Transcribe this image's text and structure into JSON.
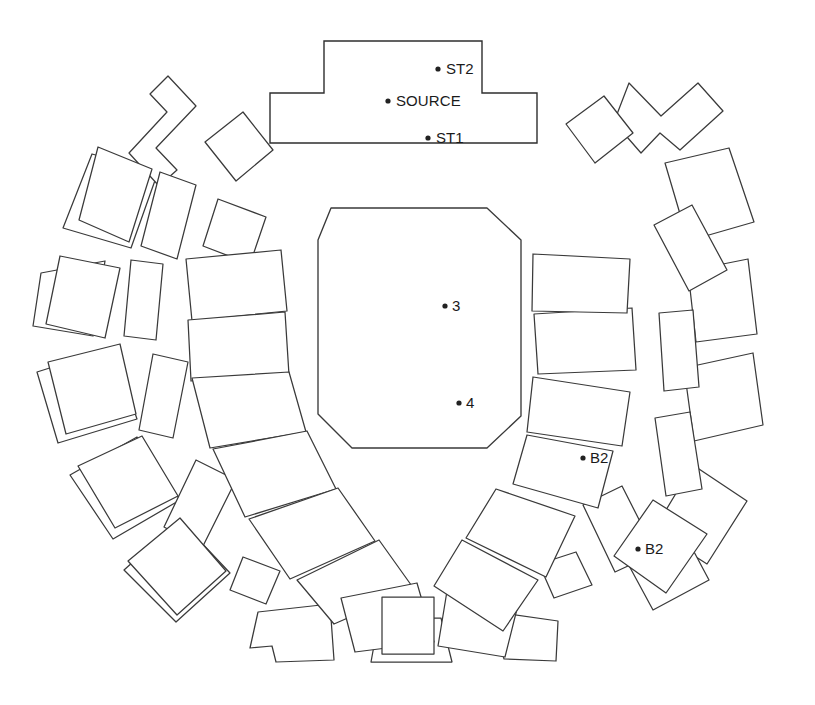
{
  "diagram": {
    "canvas": {
      "width": 815,
      "height": 705
    },
    "colors": {
      "background": "#ffffff",
      "stroke": "#3a3a3a",
      "source_stroke": "#2e2e2e",
      "marker": "#222222",
      "label_text": "#1a1a1a"
    },
    "markers": [
      {
        "id": "st2",
        "label": "ST2",
        "dot_x": 438,
        "dot_y": 69,
        "text_x": 446,
        "text_y": 70
      },
      {
        "id": "source",
        "label": "SOURCE",
        "dot_x": 388,
        "dot_y": 101,
        "text_x": 396,
        "text_y": 102
      },
      {
        "id": "st1",
        "label": "ST1",
        "dot_x": 428,
        "dot_y": 138,
        "text_x": 436,
        "text_y": 139
      },
      {
        "id": "p3",
        "label": "3",
        "dot_x": 445,
        "dot_y": 306,
        "text_x": 452,
        "text_y": 307
      },
      {
        "id": "p4",
        "label": "4",
        "dot_x": 459,
        "dot_y": 403,
        "text_x": 466,
        "text_y": 404
      },
      {
        "id": "b2-upper",
        "label": "B2",
        "dot_x": 583,
        "dot_y": 458,
        "text_x": 590,
        "text_y": 459
      },
      {
        "id": "b2-lower",
        "label": "B2",
        "dot_x": 638,
        "dot_y": 549,
        "text_x": 645,
        "text_y": 550
      }
    ],
    "source_structure": {
      "name": "source-structure",
      "points": "324,41 482,41 482,93 537,93 537,143 270,143 270,93 324,93"
    },
    "inner_chamber": {
      "name": "inner-chamber",
      "points": "331,208 487,208 521,240 521,416 487,448 352,448 318,414 318,240"
    },
    "inner_ring_blocks": [
      {
        "name": "inner-block-w-upper",
        "points": "186,259 281,250 287,311 192,321"
      },
      {
        "name": "inner-block-w-lower",
        "points": "188,320 285,312 289,375 191,381"
      },
      {
        "name": "inner-block-wsw",
        "points": "192,378 289,372 306,432 210,448"
      },
      {
        "name": "inner-block-sw-1",
        "points": "213,449 307,431 336,489 245,517"
      },
      {
        "name": "inner-block-sw-2",
        "points": "249,519 338,488 375,541 290,579"
      },
      {
        "name": "inner-block-s-1",
        "points": "297,580 379,540 414,589 334,624"
      },
      {
        "name": "inner-block-s-2",
        "points": "341,598 417,583 434,642 355,652"
      },
      {
        "name": "inner-block-s-center",
        "points": "382,597 434,597 434,654 382,654"
      },
      {
        "name": "inner-block-s-3",
        "points": "447,591 519,601 505,657 438,646"
      },
      {
        "name": "inner-block-se-1",
        "points": "462,540 538,580 503,631 434,586"
      },
      {
        "name": "inner-block-se-2",
        "points": "496,489 575,516 546,577 466,538"
      },
      {
        "name": "inner-block-e-lower",
        "points": "527,435 613,451 598,508 513,484"
      },
      {
        "name": "inner-block-e-mid",
        "points": "533,377 630,392 622,446 527,432"
      },
      {
        "name": "inner-block-e-upper",
        "points": "534,314 632,308 636,370 538,374"
      },
      {
        "name": "inner-block-ene",
        "points": "533,254 630,259 627,313 532,311"
      }
    ],
    "mid_ring_blocks": [
      {
        "name": "mid-block-nw-notched",
        "points": "168,76 196,106 156,148 177,170 159,186 129,153 167,112 150,94"
      },
      {
        "name": "mid-block-nnw",
        "points": "205,142 243,112 273,150 236,181"
      },
      {
        "name": "mid-block-nw-sq",
        "points": "98,147 152,169 129,242 79,220"
      },
      {
        "name": "mid-block-wnw-tall",
        "points": "160,172 196,185 177,259 141,246"
      },
      {
        "name": "mid-block-n-small",
        "points": "218,199 266,217 250,264 203,246"
      },
      {
        "name": "mid-block-w-sq",
        "points": "60,256 120,268 105,338 46,324"
      },
      {
        "name": "mid-block-w-tall",
        "points": "131,260 163,264 156,340 124,336"
      },
      {
        "name": "mid-block-wsw-sq",
        "points": "48,362 120,344 136,414 66,434"
      },
      {
        "name": "mid-block-sw-tall",
        "points": "153,354 188,362 173,438 139,430"
      },
      {
        "name": "mid-block-sw-sq",
        "points": "78,466 142,436 178,496 115,528"
      },
      {
        "name": "mid-block-ssw-tall",
        "points": "196,460 236,480 202,548 164,527"
      },
      {
        "name": "mid-block-ssw-sq",
        "points": "128,561 180,518 226,571 177,615"
      },
      {
        "name": "mid-block-s-small",
        "points": "243,557 280,571 266,604 230,590"
      },
      {
        "name": "mid-block-s-notch",
        "points": "258,612 330,604 334,660 276,662 272,646 250,648"
      },
      {
        "name": "mid-block-s-trap",
        "points": "379,618 441,618 452,662 371,662"
      },
      {
        "name": "mid-block-sse-notch",
        "points": "487,611 558,621 556,661 504,659 500,644 482,648"
      },
      {
        "name": "mid-block-se-small",
        "points": "539,564 576,552 592,585 554,598"
      },
      {
        "name": "mid-block-se-tall",
        "points": "583,505 622,486 656,553 615,572"
      },
      {
        "name": "mid-block-ese-sq",
        "points": "653,500 707,534 666,593 614,556"
      },
      {
        "name": "mid-block-e-tall",
        "points": "655,418 690,412 702,489 666,496"
      },
      {
        "name": "mid-block-ene-tall",
        "points": "659,313 693,310 699,387 664,391"
      },
      {
        "name": "mid-block-ne-tall",
        "points": "654,225 692,205 727,270 689,291"
      },
      {
        "name": "mid-block-ne-notched",
        "points": "629,83 661,116 698,83 723,111 680,150 660,133 641,153 614,122"
      },
      {
        "name": "mid-block-nne",
        "points": "566,124 604,96 633,133 595,163"
      }
    ],
    "outer_ring_blocks": [
      {
        "name": "outer-block-nw",
        "points": "92,154 158,172 131,248 63,228"
      },
      {
        "name": "outer-block-wnw",
        "points": "41,273 105,261 93,336 33,326"
      },
      {
        "name": "outer-block-w",
        "points": "37,372 113,348 137,419 58,443"
      },
      {
        "name": "outer-block-wsw",
        "points": "70,475 137,437 180,500 113,539"
      },
      {
        "name": "outer-block-sw",
        "points": "124,570 180,520 230,573 176,622"
      },
      {
        "name": "outer-block-ne",
        "points": "665,163 729,148 754,222 688,241"
      },
      {
        "name": "outer-block-ene",
        "points": "688,271 748,259 757,334 696,342"
      },
      {
        "name": "outer-block-e",
        "points": "684,368 753,353 763,425 694,441"
      },
      {
        "name": "outer-block-ese",
        "points": "693,465 747,501 707,564 654,530"
      },
      {
        "name": "outer-block-se",
        "points": "620,549 676,518 709,580 653,610"
      }
    ]
  }
}
